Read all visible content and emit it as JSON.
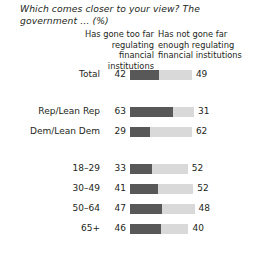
{
  "title": "Which comes closer to your view? The government … (%)",
  "headers": {
    "left": "Has gone too far regulating financial institutions",
    "right": "Has not gone far enough regulating financial institutions"
  },
  "colors": {
    "too_far": "#585858",
    "not_far_enough": "#d9d9d9",
    "text": "#231f20",
    "background": "#ffffff"
  },
  "chart_data": {
    "type": "bar",
    "title": "Which comes closer to your view? The government … (%)",
    "xlabel": "",
    "ylabel": "",
    "orientation": "horizontal",
    "stacked": true,
    "grid": false,
    "legend_position": "top",
    "xlim": [
      0,
      100
    ],
    "categories": [
      "Total",
      "Rep/Lean Rep",
      "Dem/Lean Dem",
      "18–29",
      "30–49",
      "50–64",
      "65+"
    ],
    "series": [
      {
        "name": "Has gone too far regulating financial institutions",
        "color": "#585858",
        "values": [
          42,
          63,
          29,
          33,
          41,
          47,
          46
        ]
      },
      {
        "name": "Has not gone far enough regulating financial institutions",
        "color": "#d9d9d9",
        "values": [
          49,
          31,
          62,
          52,
          52,
          48,
          40
        ]
      }
    ]
  },
  "groups": [
    {
      "name": "overall",
      "rows": [
        {
          "label": "Total",
          "left": "42",
          "right": "49",
          "left_pct": 42,
          "right_pct": 49
        }
      ]
    },
    {
      "name": "party",
      "rows": [
        {
          "label": "Rep/Lean Rep",
          "left": "63",
          "right": "31",
          "left_pct": 63,
          "right_pct": 31
        },
        {
          "label": "Dem/Lean Dem",
          "left": "29",
          "right": "62",
          "left_pct": 29,
          "right_pct": 62
        }
      ]
    },
    {
      "name": "age",
      "rows": [
        {
          "label": "18–29",
          "left": "33",
          "right": "52",
          "left_pct": 33,
          "right_pct": 52
        },
        {
          "label": "30–49",
          "left": "41",
          "right": "52",
          "left_pct": 41,
          "right_pct": 52
        },
        {
          "label": "50–64",
          "left": "47",
          "right": "48",
          "left_pct": 47,
          "right_pct": 48
        },
        {
          "label": "65+",
          "left": "46",
          "right": "40",
          "left_pct": 46,
          "right_pct": 40
        }
      ]
    }
  ],
  "scale": {
    "px_per_pct": 0.68
  }
}
